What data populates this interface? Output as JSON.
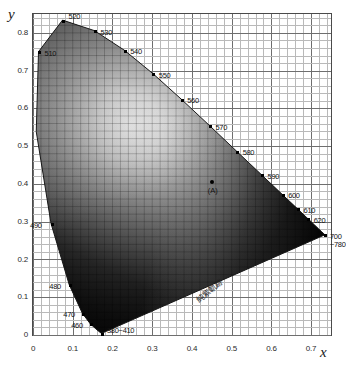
{
  "chart_data": {
    "type": "scatter",
    "title": "",
    "subtitle": "",
    "xlabel": "x",
    "ylabel": "y",
    "xlim": [
      0,
      0.75
    ],
    "ylim": [
      0,
      0.85
    ],
    "grid": true,
    "grid_major_step": 0.1,
    "grid_minor_step": 0.02,
    "legend_position": "none",
    "xticks": [
      "0",
      "0.1",
      "0.2",
      "0.3",
      "0.4",
      "0.5",
      "0.6",
      "0.7"
    ],
    "xtick_values": [
      0,
      0.1,
      0.2,
      0.3,
      0.4,
      0.5,
      0.6,
      0.7
    ],
    "yticks": [
      "0",
      "0.1",
      "0.2",
      "0.3",
      "0.4",
      "0.5",
      "0.6",
      "0.7",
      "0.8"
    ],
    "ytick_values": [
      0,
      0.1,
      0.2,
      0.3,
      0.4,
      0.5,
      0.6,
      0.7,
      0.8
    ],
    "spectral_locus": [
      {
        "wavelength": 380,
        "x": 0.1741,
        "y": 0.005
      },
      {
        "wavelength": 390,
        "x": 0.1738,
        "y": 0.0049
      },
      {
        "wavelength": 400,
        "x": 0.1733,
        "y": 0.0048
      },
      {
        "wavelength": 410,
        "x": 0.1726,
        "y": 0.0048
      },
      {
        "wavelength": 420,
        "x": 0.1714,
        "y": 0.0051
      },
      {
        "wavelength": 430,
        "x": 0.1689,
        "y": 0.0069
      },
      {
        "wavelength": 440,
        "x": 0.1644,
        "y": 0.0109
      },
      {
        "wavelength": 450,
        "x": 0.1566,
        "y": 0.0177
      },
      {
        "wavelength": 460,
        "x": 0.144,
        "y": 0.0297
      },
      {
        "wavelength": 470,
        "x": 0.1241,
        "y": 0.0578
      },
      {
        "wavelength": 480,
        "x": 0.0913,
        "y": 0.1327
      },
      {
        "wavelength": 490,
        "x": 0.0454,
        "y": 0.295
      },
      {
        "wavelength": 500,
        "x": 0.0082,
        "y": 0.5384
      },
      {
        "wavelength": 510,
        "x": 0.0139,
        "y": 0.7502
      },
      {
        "wavelength": 520,
        "x": 0.0743,
        "y": 0.8338
      },
      {
        "wavelength": 530,
        "x": 0.1547,
        "y": 0.8059
      },
      {
        "wavelength": 540,
        "x": 0.2296,
        "y": 0.7543
      },
      {
        "wavelength": 550,
        "x": 0.3016,
        "y": 0.6923
      },
      {
        "wavelength": 560,
        "x": 0.3731,
        "y": 0.6245
      },
      {
        "wavelength": 570,
        "x": 0.4441,
        "y": 0.5547
      },
      {
        "wavelength": 580,
        "x": 0.5125,
        "y": 0.4866
      },
      {
        "wavelength": 590,
        "x": 0.5752,
        "y": 0.4242
      },
      {
        "wavelength": 600,
        "x": 0.627,
        "y": 0.3725
      },
      {
        "wavelength": 610,
        "x": 0.6658,
        "y": 0.334
      },
      {
        "wavelength": 620,
        "x": 0.6915,
        "y": 0.3083
      },
      {
        "wavelength": 630,
        "x": 0.7079,
        "y": 0.292
      },
      {
        "wavelength": 640,
        "x": 0.719,
        "y": 0.2809
      },
      {
        "wavelength": 650,
        "x": 0.726,
        "y": 0.274
      },
      {
        "wavelength": 660,
        "x": 0.73,
        "y": 0.27
      },
      {
        "wavelength": 670,
        "x": 0.732,
        "y": 0.268
      },
      {
        "wavelength": 680,
        "x": 0.7334,
        "y": 0.2666
      },
      {
        "wavelength": 700,
        "x": 0.7347,
        "y": 0.2653
      },
      {
        "wavelength": 780,
        "x": 0.7347,
        "y": 0.2653
      }
    ],
    "wavelength_labels": [
      {
        "label": "520",
        "wavelength": 520,
        "x": 0.0743,
        "y": 0.8338,
        "dx": 5,
        "dy": -9
      },
      {
        "label": "530",
        "wavelength": 530,
        "x": 0.1547,
        "y": 0.8059,
        "dx": 5,
        "dy": -4
      },
      {
        "label": "510",
        "wavelength": 510,
        "x": 0.0139,
        "y": 0.7502,
        "dx": 5,
        "dy": -4
      },
      {
        "label": "540",
        "wavelength": 540,
        "x": 0.2296,
        "y": 0.7543,
        "dx": 5,
        "dy": -4
      },
      {
        "label": "550",
        "wavelength": 550,
        "x": 0.3016,
        "y": 0.6923,
        "dx": 5,
        "dy": -4
      },
      {
        "label": "560",
        "wavelength": 560,
        "x": 0.3731,
        "y": 0.6245,
        "dx": 5,
        "dy": -4
      },
      {
        "label": "570",
        "wavelength": 570,
        "x": 0.4441,
        "y": 0.5547,
        "dx": 5,
        "dy": -4
      },
      {
        "label": "580",
        "wavelength": 580,
        "x": 0.5125,
        "y": 0.4866,
        "dx": 5,
        "dy": -4
      },
      {
        "label": "590",
        "wavelength": 590,
        "x": 0.5752,
        "y": 0.4242,
        "dx": 5,
        "dy": -4
      },
      {
        "label": "600",
        "wavelength": 600,
        "x": 0.627,
        "y": 0.3725,
        "dx": 5,
        "dy": -4
      },
      {
        "label": "610",
        "wavelength": 610,
        "x": 0.6658,
        "y": 0.334,
        "dx": 5,
        "dy": -4
      },
      {
        "label": "620",
        "wavelength": 620,
        "x": 0.6915,
        "y": 0.3083,
        "dx": 5,
        "dy": -4
      },
      {
        "label": "700",
        "wavelength": 700,
        "x": 0.7347,
        "y": 0.2653,
        "dx": 4,
        "dy": -4
      },
      {
        "label": "~780",
        "wavelength": 780,
        "x": 0.7347,
        "y": 0.2653,
        "dx": 4,
        "dy": 4
      },
      {
        "label": "490",
        "wavelength": 490,
        "x": 0.0454,
        "y": 0.295,
        "dx": -22,
        "dy": -4
      },
      {
        "label": "480",
        "wavelength": 480,
        "x": 0.0913,
        "y": 0.1327,
        "dx": -21,
        "dy": -4
      },
      {
        "label": "470",
        "wavelength": 470,
        "x": 0.1241,
        "y": 0.0578,
        "dx": -20,
        "dy": -4
      },
      {
        "label": "460",
        "wavelength": 460,
        "x": 0.144,
        "y": 0.0297,
        "dx": -20,
        "dy": -4
      },
      {
        "label": "380~410",
        "wavelength": 395,
        "x": 0.1735,
        "y": 0.005,
        "dx": 4,
        "dy": -8
      }
    ],
    "annotations": [
      {
        "name": "purple-locus-label",
        "text": "純紫軌跡",
        "x": 0.4,
        "y": 0.105,
        "rotation": -38
      },
      {
        "name": "illuminant-a-label",
        "text": "(A)",
        "x": 0.4476,
        "y": 0.4074
      }
    ],
    "points": [
      {
        "name": "illuminant-A",
        "label": "(A)",
        "x": 0.4476,
        "y": 0.4074
      }
    ],
    "colors": {
      "background": "#ffffff",
      "grid_minor": "#b9b9b9",
      "grid_major": "#6e6e6e",
      "axis": "#3c3c3c",
      "text": "#1a1a1a",
      "marker": "#000000",
      "whitepoint_highlight": "#f2f2f2"
    }
  }
}
